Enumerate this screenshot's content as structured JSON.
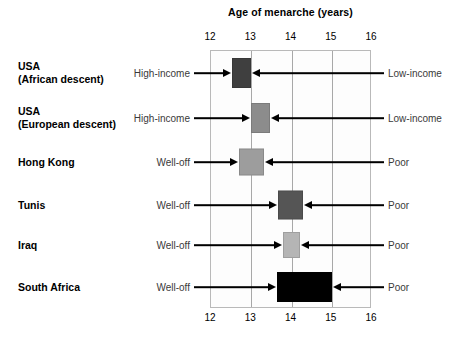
{
  "chart_data": {
    "type": "bar",
    "title": "Age of menarche (years)",
    "xlabel": "Age of menarche (years)",
    "ylabel": "",
    "xlim": [
      12,
      16
    ],
    "xticks": [
      12,
      13,
      14,
      15,
      16
    ],
    "xtick_labels": [
      "12",
      "13",
      "14",
      "15",
      "16"
    ],
    "grid": true,
    "axis_labels_top": true,
    "axis_labels_bottom": true,
    "legend": "none",
    "orientation": "horizontal",
    "categories": [
      "USA\n(African descent)",
      "USA\n(European descent)",
      "Hong Kong",
      "Tunis",
      "Iraq",
      "South Africa"
    ],
    "series": [
      {
        "name": "Age of menarche range",
        "bars": [
          {
            "category": "USA (African descent)",
            "start": 12.55,
            "end": 13.02,
            "color": "#3f3f3f",
            "left_label": "High-income",
            "right_label": "Low-income"
          },
          {
            "category": "USA (European descent)",
            "start": 13.02,
            "end": 13.5,
            "color": "#8c8c8c",
            "left_label": "High-income",
            "right_label": "Low-income"
          },
          {
            "category": "Hong Kong",
            "start": 12.72,
            "end": 13.33,
            "color": "#9d9d9d",
            "left_label": "Well-off",
            "right_label": "Poor"
          },
          {
            "category": "Tunis",
            "start": 13.7,
            "end": 14.3,
            "color": "#555555",
            "left_label": "Well-off",
            "right_label": "Poor"
          },
          {
            "category": "Iraq",
            "start": 13.82,
            "end": 14.24,
            "color": "#b5b5b5",
            "left_label": "Well-off",
            "right_label": "Poor"
          },
          {
            "category": "South Africa",
            "start": 13.66,
            "end": 15.02,
            "color": "#000000",
            "left_label": "Well-off",
            "right_label": "Poor"
          }
        ]
      }
    ]
  },
  "rows": [
    {
      "name": "USA\n(African descent)",
      "left_label": "High-income",
      "right_label": "Low-income",
      "bar_start": 12.55,
      "bar_end": 13.02,
      "bar_color": "#3f3f3f"
    },
    {
      "name": "USA\n(European descent)",
      "left_label": "High-income",
      "right_label": "Low-income",
      "bar_start": 13.02,
      "bar_end": 13.5,
      "bar_color": "#8c8c8c"
    },
    {
      "name": "Hong Kong",
      "left_label": "Well-off",
      "right_label": "Poor",
      "bar_start": 12.72,
      "bar_end": 13.33,
      "bar_color": "#9d9d9d"
    },
    {
      "name": "Tunis",
      "left_label": "Well-off",
      "right_label": "Poor",
      "bar_start": 13.7,
      "bar_end": 14.3,
      "bar_color": "#555555"
    },
    {
      "name": "Iraq",
      "left_label": "Well-off",
      "right_label": "Poor",
      "bar_start": 13.82,
      "bar_end": 14.24,
      "bar_color": "#b5b5b5"
    },
    {
      "name": "South Africa",
      "left_label": "Well-off",
      "right_label": "Poor",
      "bar_start": 13.66,
      "bar_end": 15.02,
      "bar_color": "#000000"
    }
  ],
  "axis": {
    "title": "Age of menarche (years)",
    "ticks": [
      "12",
      "13",
      "14",
      "15",
      "16"
    ]
  }
}
